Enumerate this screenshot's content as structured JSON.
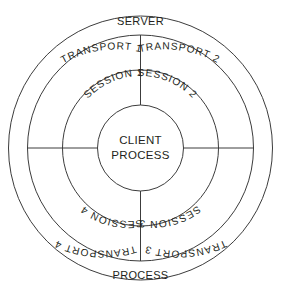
{
  "diagram": {
    "type": "concentric-ring-diagram",
    "background_color": "#ffffff",
    "stroke_color": "#3c3c3c",
    "text_color": "#231f20",
    "center": {
      "x": 140.5,
      "y": 148
    },
    "radii": {
      "outer": 132,
      "second": 113,
      "third": 78,
      "core": 43
    },
    "outer_band": {
      "top_label": "SERVER",
      "bottom_label": "PROCESS"
    },
    "core": {
      "line1": "CLIENT",
      "line2": "PROCESS"
    },
    "transport_ring": {
      "quadrants": [
        {
          "position": "upper-left",
          "label": "TRANSPORT 1"
        },
        {
          "position": "upper-right",
          "label": "TRANSPORT 2"
        },
        {
          "position": "lower-right",
          "label": "TRANSPORT 3"
        },
        {
          "position": "lower-left",
          "label": "TRANSPORT 4"
        }
      ]
    },
    "session_ring": {
      "quadrants": [
        {
          "position": "upper-left",
          "label": "SESSION 1"
        },
        {
          "position": "upper-right",
          "label": "SESSION 2"
        },
        {
          "position": "lower-right",
          "label": "SESSION 3"
        },
        {
          "position": "lower-left",
          "label": "SESSION 4"
        }
      ]
    },
    "dividers": [
      {
        "name": "divider-top",
        "orientation": "vertical"
      },
      {
        "name": "divider-bottom",
        "orientation": "vertical"
      },
      {
        "name": "divider-left",
        "orientation": "horizontal"
      },
      {
        "name": "divider-right",
        "orientation": "horizontal"
      }
    ]
  }
}
